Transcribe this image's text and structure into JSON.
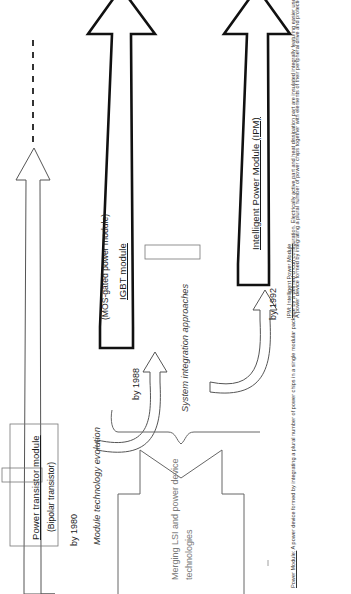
{
  "diagram": {
    "title_axis": "Module technology evolution",
    "axis_secondary": "System integration approaches",
    "axis_tertiary_line1": "Merging LSI  and power device",
    "axis_tertiary_line2": "technologies",
    "stages": [
      {
        "id": "power-transistor-module",
        "title": "Power transistor module",
        "subtitle": "(Bipolar transistor)",
        "year": "by 1980"
      },
      {
        "id": "igbt-module",
        "title": "IGBT module",
        "subtitle": "(MOS-gated power module)",
        "year": "by 1988"
      },
      {
        "id": "intelligent-power-module",
        "title": "Intelligent Power Module (IPM)",
        "subtitle": "",
        "year": "by 1992"
      }
    ],
    "notes": [
      {
        "id": "ipm-note",
        "heading": "IPM: Intelligent Power Module",
        "body": "A power device formed by integrating a plural number of power chips together with elements of their peripheral drive and protection functions in a single modular package housing by an optimum design concept. Electrically active part and heat dissipation part are insulated integrally featuring easier use and high reliability and superior performance."
      },
      {
        "id": "power-module-note",
        "heading": "Power Module:",
        "body": " A power device formed by integrating a plural number of power chips in a single modular package by a defined circuit configuration. Electrically active part and heat dissipation part are insulated integrally featuring easier use. Power modules come in various forms: Thyristor type, Bipolar transistor type, Diode type, IGBT type, MOSFET type, etc."
      }
    ]
  }
}
